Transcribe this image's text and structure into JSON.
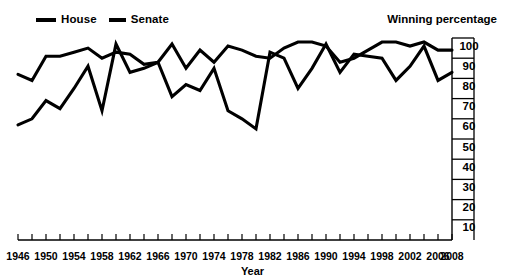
{
  "legend": {
    "position": "top-left",
    "items": [
      {
        "label": "House",
        "key": "house",
        "color": "#000000"
      },
      {
        "label": "Senate",
        "key": "senate",
        "color": "#000000"
      }
    ]
  },
  "titles": {
    "y_axis_title": "Winning percentage",
    "x_axis_title": "Year"
  },
  "chart_data": {
    "type": "line",
    "title": "Winning percentage",
    "xlabel": "Year",
    "ylabel": "Winning percentage",
    "xlim": [
      1946,
      2008
    ],
    "ylim": [
      0,
      100
    ],
    "grid": false,
    "legend_position": "top-left",
    "y_axis_side": "right",
    "yticks": [
      100,
      90,
      80,
      70,
      60,
      50,
      40,
      30,
      20,
      10
    ],
    "ytick_labels": [
      "100",
      "90",
      "80",
      "70",
      "60",
      "50",
      "40",
      "30",
      "20",
      "10"
    ],
    "xticks": [
      1946,
      1948,
      1950,
      1952,
      1954,
      1956,
      1958,
      1960,
      1962,
      1964,
      1966,
      1968,
      1970,
      1972,
      1974,
      1976,
      1978,
      1980,
      1982,
      1984,
      1986,
      1988,
      1990,
      1992,
      1994,
      1996,
      1998,
      2000,
      2002,
      2004,
      2006,
      2008
    ],
    "xtick_labels": [
      "1946",
      "1950",
      "1954",
      "1958",
      "1962",
      "1966",
      "1970",
      "1974",
      "1978",
      "1982",
      "1986",
      "1990",
      "1994",
      "1998",
      "2002",
      "2006",
      "2008"
    ],
    "xtick_label_years": [
      1946,
      1950,
      1954,
      1958,
      1962,
      1966,
      1970,
      1974,
      1978,
      1982,
      1986,
      1990,
      1994,
      1998,
      2002,
      2006,
      2008
    ],
    "x": [
      1946,
      1948,
      1950,
      1952,
      1954,
      1956,
      1958,
      1960,
      1962,
      1964,
      1966,
      1968,
      1970,
      1972,
      1974,
      1976,
      1978,
      1980,
      1982,
      1984,
      1986,
      1988,
      1990,
      1992,
      1994,
      1996,
      1998,
      2000,
      2002,
      2004,
      2006,
      2008
    ],
    "series": [
      {
        "name": "House",
        "color": "#000000",
        "values": [
          82,
          79,
          91,
          91,
          93,
          95,
          90,
          93,
          92,
          87,
          88,
          97,
          85,
          94,
          88,
          96,
          94,
          91,
          90,
          95,
          98,
          98,
          96,
          88,
          90,
          94,
          98,
          98,
          96,
          98,
          94,
          94
        ]
      },
      {
        "name": "Senate",
        "color": "#000000",
        "values": [
          57,
          60,
          69,
          65,
          75,
          86,
          64,
          97,
          83,
          85,
          88,
          71,
          77,
          74,
          85,
          64,
          60,
          55,
          93,
          90,
          75,
          85,
          97,
          83,
          92,
          91,
          90,
          79,
          86,
          96,
          79,
          83
        ]
      }
    ]
  }
}
